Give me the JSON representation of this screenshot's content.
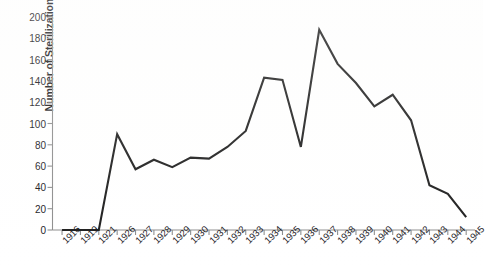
{
  "chart_data": {
    "type": "line",
    "title": "",
    "subtitle": "",
    "xlabel": "",
    "ylabel": "Number of Sterilizations Performed",
    "categories": [
      "1916",
      "1919",
      "1921",
      "1926",
      "1927",
      "1928",
      "1929",
      "1930",
      "1931",
      "1932",
      "1933",
      "1934",
      "1935",
      "1936",
      "1937",
      "1938",
      "1939",
      "1940",
      "1941",
      "1942",
      "1943",
      "1944",
      "1945"
    ],
    "values": [
      0,
      0,
      0,
      90,
      57,
      66,
      59,
      68,
      67,
      78,
      93,
      143,
      141,
      78,
      188,
      156,
      138,
      116,
      127,
      103,
      42,
      34,
      12
    ],
    "series": [
      {
        "name": "Number of Sterilizations Performed",
        "values": [
          0,
          0,
          0,
          90,
          57,
          66,
          59,
          68,
          67,
          78,
          93,
          143,
          141,
          78,
          188,
          156,
          138,
          116,
          127,
          103,
          42,
          34,
          12
        ]
      }
    ],
    "ylim": [
      0,
      200
    ],
    "ytick_values": [
      0,
      20,
      40,
      60,
      80,
      100,
      120,
      140,
      160,
      180,
      200
    ],
    "ytick_labels": [
      "0",
      "20",
      "40",
      "60",
      "80",
      "100",
      "120",
      "140",
      "160",
      "180",
      "200"
    ],
    "grid": false,
    "legend": false,
    "legend_position": "none",
    "line_color": "#1a1a1a",
    "axis_color": "#8c8c8c",
    "background_color": "#ffffff",
    "xtick_rotation": -45
  }
}
